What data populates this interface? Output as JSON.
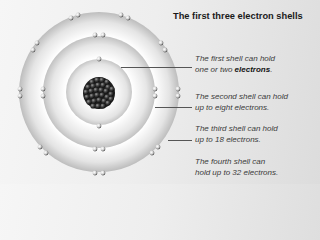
{
  "title": "The first three electron shells",
  "notes": [
    {
      "line1": "The first shell can hold",
      "line2_pre": "one or two ",
      "line2_bold": "electrons",
      "line2_post": "."
    },
    {
      "line1": "The second shell can hold",
      "line2": "up to eight electrons."
    },
    {
      "line1": "The third shell can hold",
      "line2": "up to 18 electrons."
    },
    {
      "line1": "The fourth shell can",
      "line2": "hold up to 32 electrons."
    }
  ],
  "colors": {
    "background_left": "#f6f6f6",
    "background_right": "#dcdcdc",
    "shell": "#e6e6e6",
    "nucleus": "#2a2a2a",
    "leader_line": "#555555"
  },
  "atom": {
    "center": [
      99,
      92
    ],
    "shell_radii": [
      33,
      56,
      80
    ],
    "nucleus_radius": 16
  }
}
